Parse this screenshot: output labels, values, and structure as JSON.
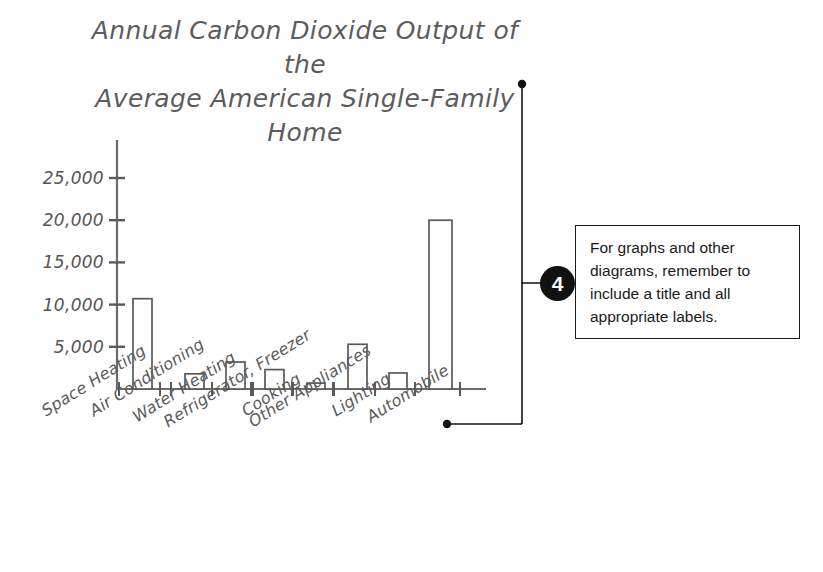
{
  "figure": {
    "background_color": "#ffffff",
    "ink_color": "#5a5a5a",
    "callout_color": "#111111"
  },
  "chart_data": {
    "type": "bar",
    "title": "Annual Carbon Dioxide Output of the\nAverage American Single-Family Home",
    "xlabel": "",
    "ylabel": "",
    "grid": false,
    "legend": "none",
    "ylim": [
      0,
      27000
    ],
    "ytick_values": [
      5000,
      10000,
      15000,
      20000,
      25000
    ],
    "ytick_labels": [
      "5,000",
      "10,000",
      "15,000",
      "20,000",
      "25,000"
    ],
    "categories": [
      "Space Heating",
      "Air Conditioning",
      "Water Heating",
      "Refrigerator, Freezer",
      "Cooking",
      "Other Appliances",
      "Lighting",
      "Automobile"
    ],
    "values": [
      10700,
      1800,
      3200,
      2300,
      700,
      5300,
      1900,
      20000
    ]
  },
  "callout": {
    "number": "4",
    "text": "For graphs and other diagrams, remember to include a title and all appropriate labels."
  }
}
